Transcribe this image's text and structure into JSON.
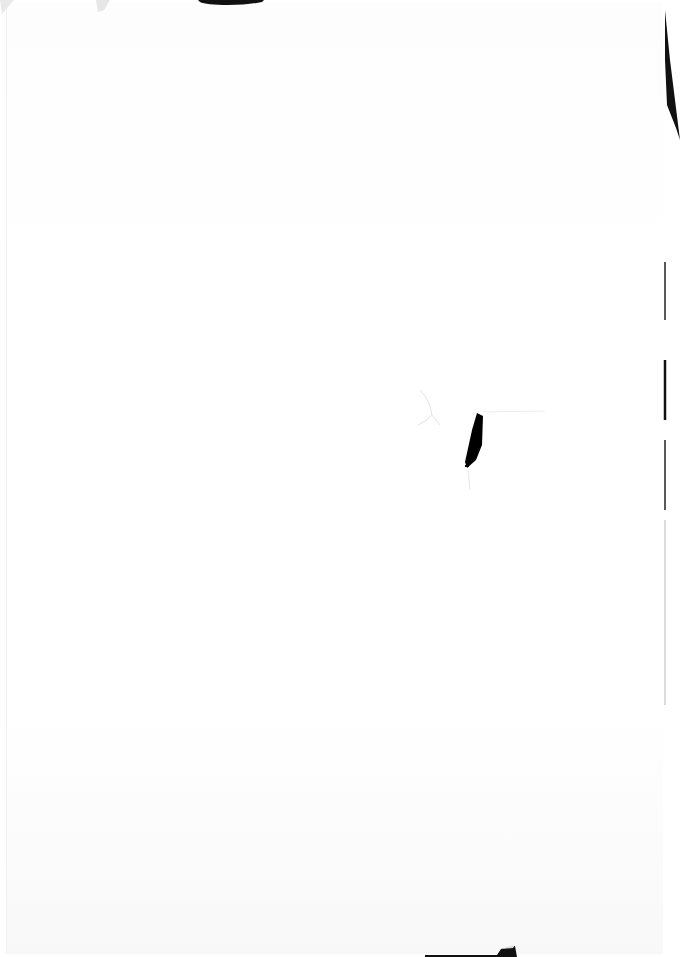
{
  "document": {
    "type": "scanned-page",
    "content": "",
    "background_color": "#ffffff",
    "artifacts": [
      {
        "name": "top-edge-mark",
        "color": "#111111"
      },
      {
        "name": "right-edge-shadow",
        "color": "#111111"
      },
      {
        "name": "center-hole-mark",
        "color": "#000000"
      },
      {
        "name": "bottom-edge-mark",
        "color": "#111111"
      }
    ]
  }
}
